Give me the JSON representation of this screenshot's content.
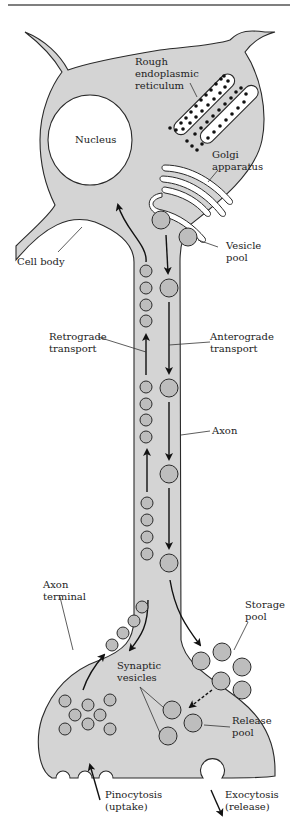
{
  "labels": {
    "rough_er_1": "Rough",
    "rough_er_2": "endoplasmic",
    "rough_er_3": "reticulum",
    "nucleus": "Nucleus",
    "golgi_1": "Golgi",
    "golgi_2": "apparatus",
    "cell_body": "Cell body",
    "vesicle_pool_1": "Vesicle",
    "vesicle_pool_2": "pool",
    "retrograde_1": "Retrograde",
    "retrograde_2": "transport",
    "anterograde_1": "Anterograde",
    "anterograde_2": "transport",
    "axon": "Axon",
    "axon_terminal_1": "Axon",
    "axon_terminal_2": "terminal",
    "storage_pool_1": "Storage",
    "storage_pool_2": "pool",
    "synaptic_vesicles_1": "Synaptic",
    "synaptic_vesicles_2": "vesicles",
    "release_pool_1": "Release",
    "release_pool_2": "pool",
    "pinocytosis_1": "Pinocytosis",
    "pinocytosis_2": "(uptake)",
    "exocytosis_1": "Exocytosis",
    "exocytosis_2": "(release)"
  },
  "colors": {
    "cytoplasm": "#d4d4d4",
    "vesicle": "#bdbdbd",
    "outline": "#2a2a2a",
    "background": "#ffffff"
  }
}
